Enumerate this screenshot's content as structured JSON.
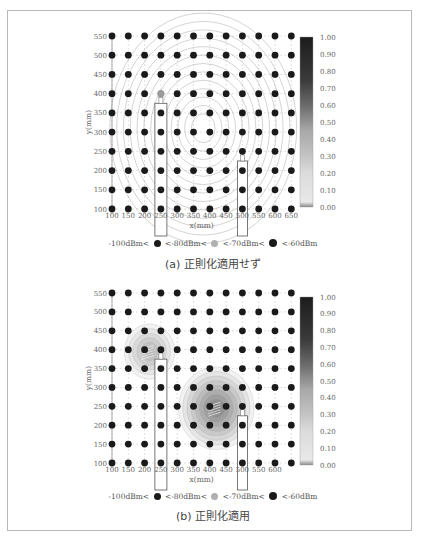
{
  "figure": {
    "panels": [
      {
        "id": "a",
        "caption": "(a) 正則化適用せず",
        "xlabel": "x(mm)",
        "ylabel": "y(mm)",
        "x_ticks": [
          "100",
          "150",
          "200",
          "250",
          "300",
          "350",
          "400",
          "450",
          "500",
          "550",
          "600",
          "650"
        ],
        "y_ticks": [
          "550",
          "500",
          "450",
          "400",
          "350",
          "300",
          "250",
          "200",
          "150",
          "100"
        ],
        "colorbar_ticks": [
          "1.00",
          "0.90",
          "0.80",
          "0.70",
          "0.60",
          "0.50",
          "0.40",
          "0.30",
          "0.20",
          "0.10",
          "0.00"
        ],
        "legend": {
          "label1": "-100dBm<",
          "label2": "<-80dBm<",
          "label3": "<-70dBm<",
          "label4": "<-60dBm"
        }
      },
      {
        "id": "b",
        "caption": "(b) 正則化適用",
        "xlabel": "x(mm)",
        "ylabel": "y(mm)",
        "x_ticks": [
          "100",
          "150",
          "200",
          "250",
          "300",
          "350",
          "400",
          "450",
          "500",
          "550",
          "600"
        ],
        "y_ticks": [
          "550",
          "500",
          "450",
          "400",
          "350",
          "300",
          "250",
          "200",
          "150",
          "100"
        ],
        "colorbar_ticks": [
          "1.00",
          "0.90",
          "0.80",
          "0.70",
          "0.60",
          "0.50",
          "0.40",
          "0.30",
          "0.20",
          "0.10",
          "0.00"
        ],
        "legend": {
          "label1": "-100dBm<",
          "label2": "<-80dBm<",
          "label3": "<-70dBm<",
          "label4": "<-60dBm"
        }
      }
    ],
    "colors": {
      "dot": "#1a1a1a",
      "dot_mid": "#9a9a9a",
      "grid": "#cccccc",
      "contour": "#8c8c8c",
      "frame": "#b8b8b8"
    }
  },
  "chart_data": [
    {
      "type": "heatmap",
      "title": "(a) 正則化適用せず",
      "xlabel": "x(mm)",
      "ylabel": "y(mm)",
      "x": [
        100,
        150,
        200,
        250,
        300,
        350,
        400,
        450,
        500,
        550,
        600,
        650
      ],
      "y": [
        100,
        150,
        200,
        250,
        300,
        350,
        400,
        450,
        500,
        550
      ],
      "xlim": [
        100,
        650
      ],
      "ylim": [
        100,
        550
      ],
      "colorbar": {
        "min": 0.0,
        "max": 1.0,
        "ticks": [
          0,
          0.1,
          0.2,
          0.3,
          0.4,
          0.5,
          0.6,
          0.7,
          0.8,
          0.9,
          1.0
        ]
      },
      "contour_center": [
        380,
        310
      ],
      "description": "Broad concentric contour field centered near (380,310) mm; measurement grid points at every 50 mm, nearly all strong (<-60dBm) except one mid-level point at (250,400).",
      "antennas": [
        {
          "x": 250,
          "y_top": 375,
          "y_bottom": 30
        },
        {
          "x": 500,
          "y_top": 225,
          "y_bottom": 30
        }
      ],
      "legend": [
        "-100dBm<",
        "<-80dBm<",
        "<-70dBm<",
        "<-60dBm"
      ]
    },
    {
      "type": "heatmap",
      "title": "(b) 正則化適用",
      "xlabel": "x(mm)",
      "ylabel": "y(mm)",
      "x": [
        100,
        150,
        200,
        250,
        300,
        350,
        400,
        450,
        500,
        550,
        600,
        650
      ],
      "y": [
        100,
        150,
        200,
        250,
        300,
        350,
        400,
        450,
        500,
        550
      ],
      "xlim": [
        100,
        650
      ],
      "ylim": [
        100,
        550
      ],
      "colorbar": {
        "min": 0.0,
        "max": 1.0,
        "ticks": [
          0,
          0.1,
          0.2,
          0.3,
          0.4,
          0.5,
          0.6,
          0.7,
          0.8,
          0.9,
          1.0
        ]
      },
      "hotspots": [
        {
          "x": 215,
          "y": 395,
          "peak": 0.45
        },
        {
          "x": 420,
          "y": 245,
          "peak": 0.6
        }
      ],
      "antennas": [
        {
          "x": 250,
          "y_top": 375,
          "y_bottom": 30
        },
        {
          "x": 500,
          "y_top": 225,
          "y_bottom": 30
        }
      ],
      "legend": [
        "-100dBm<",
        "<-80dBm<",
        "<-70dBm<",
        "<-60dBm"
      ]
    }
  ]
}
